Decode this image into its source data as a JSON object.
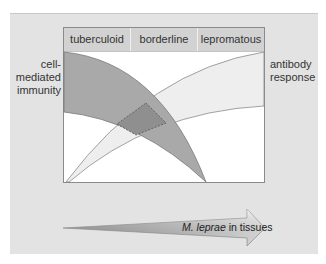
{
  "header": {
    "categories": [
      "tuberculoid",
      "borderline",
      "lepromatous"
    ]
  },
  "labels": {
    "left_line1": "cell-",
    "left_line2": "mediated",
    "left_line3": "immunity",
    "right_line1": "antibody",
    "right_line2": "response"
  },
  "arrow": {
    "italic": "M. leprae",
    "rest": " in tissues"
  },
  "colors": {
    "panel": "#e3e3e3",
    "cmi_band": "#a9a9a9",
    "antibody_band": "#efefef",
    "overlap": "#8f8f8f"
  }
}
